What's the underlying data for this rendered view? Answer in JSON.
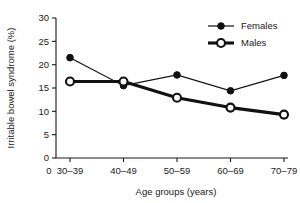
{
  "chart_data": {
    "type": "line",
    "title": "",
    "xlabel": "Age groups (years)",
    "ylabel": "Irritable bowel syndrome (%)",
    "categories": [
      "30–39",
      "40–49",
      "50–59",
      "60–69",
      "70–79"
    ],
    "yticks": [
      "0",
      "5",
      "10",
      "15",
      "20",
      "25",
      "30"
    ],
    "ytick_values": [
      0,
      5,
      10,
      15,
      20,
      25,
      30
    ],
    "ylim": [
      0,
      30
    ],
    "grid": false,
    "legend_position": "top-right",
    "series": [
      {
        "name": "Females",
        "marker": "filled-circle",
        "line_width": "thin",
        "values": [
          21.5,
          15.5,
          17.8,
          14.4,
          17.7
        ]
      },
      {
        "name": "Males",
        "marker": "open-circle",
        "line_width": "thick",
        "values": [
          16.4,
          16.4,
          12.9,
          10.8,
          9.3
        ]
      }
    ],
    "colors": {
      "ink": "#111111",
      "background": "#ffffff"
    }
  },
  "legend": {
    "items": [
      {
        "label": "Females",
        "marker": "filled-circle-icon"
      },
      {
        "label": "Males",
        "marker": "open-circle-icon"
      }
    ]
  },
  "axes": {
    "origin_label": "0"
  }
}
